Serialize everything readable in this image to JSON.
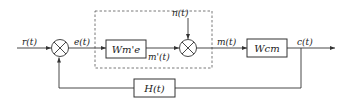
{
  "signals": {
    "reference": "r(t)",
    "error": "e(t)",
    "noise": "n(t)",
    "intermediate": "m'(t)",
    "manipulated": "m(t)",
    "output": "c(t)"
  },
  "blocks": {
    "controller": "Wm'e",
    "plant": "Wcm",
    "feedback": "H(t)"
  }
}
